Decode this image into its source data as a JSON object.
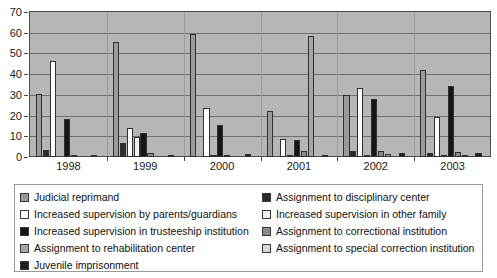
{
  "chart_data": {
    "type": "bar",
    "title": "",
    "subtitle": "",
    "xlabel": "",
    "ylabel": "",
    "ylim": [
      0,
      70
    ],
    "ytick_step": 10,
    "yticks": [
      0,
      10,
      20,
      30,
      40,
      50,
      60,
      70
    ],
    "grid": true,
    "grid_axis": "y",
    "legend_position": "bottom",
    "legend_columns": 2,
    "categories": [
      "1998",
      "1999",
      "2000",
      "2001",
      "2002",
      "2003"
    ],
    "series": [
      {
        "name": "Judicial reprimand",
        "color": "#9a9a9a",
        "values": [
          30.5,
          0,
          0,
          0,
          30.0,
          0
        ]
      },
      {
        "name": "Assignment to disciplinary center",
        "color": "#2b2b2b",
        "values": [
          3.3,
          7.0,
          0,
          0,
          2.8,
          2.0
        ]
      },
      {
        "name": "Increased supervision by parents/guardians",
        "color": "#ffffff",
        "values": [
          46.5,
          13.9,
          23.5,
          8.5,
          33.5,
          19.1
        ]
      },
      {
        "name": "Increased supervision in other family",
        "color": "#f2f2f2",
        "values": [
          0,
          9.5,
          0.7,
          0.8,
          1.0,
          0.6
        ]
      },
      {
        "name": "Increased supervision in trusteeship institution",
        "color": "#161616",
        "values": [
          18.5,
          11.4,
          15.4,
          8.0,
          27.9,
          34.3
        ]
      },
      {
        "name": "Assignment to correctional institution",
        "color": "#8a8a8a",
        "values": [
          0.5,
          1.9,
          0.4,
          2.7,
          3.0,
          2.4
        ]
      },
      {
        "name": "Assignment to rehabilitation center",
        "color": "#a6a6a6",
        "values": [
          0,
          0,
          0,
          0,
          1.4,
          0.8
        ]
      },
      {
        "name": "Assignment to special correction institution",
        "color": "#d8d8d8",
        "values": [
          0,
          0,
          0,
          0,
          0,
          0
        ]
      },
      {
        "name": "Juvenile imprisonment",
        "color": "#1f1f1f",
        "values": [
          0.9,
          1.0,
          1.3,
          0.6,
          1.8,
          1.7
        ]
      }
    ],
    "group_extra_bars": {
      "2000": {
        "series": "Judicial reprimand",
        "value": 59.5
      },
      "2001": {
        "series": "Judicial reprimand",
        "value": 22.0
      },
      "1999": {
        "series": "Judicial reprimand",
        "value": 55.5
      },
      "2003": {
        "series": "Judicial reprimand",
        "value": 41.8
      },
      "2001b": {
        "series": "Assignment to rehabilitation center",
        "value": 58.6
      }
    }
  },
  "legend": {
    "left": [
      "Judicial reprimand",
      "Increased supervision by parents/guardians",
      "Increased supervision in trusteeship institution",
      "Assignment to rehabilitation center",
      "Juvenile imprisonment"
    ],
    "right": [
      "Assignment to disciplinary center",
      "Increased supervision in other family",
      "Assignment to correctional institution",
      "Assignment to special correction institution"
    ]
  }
}
